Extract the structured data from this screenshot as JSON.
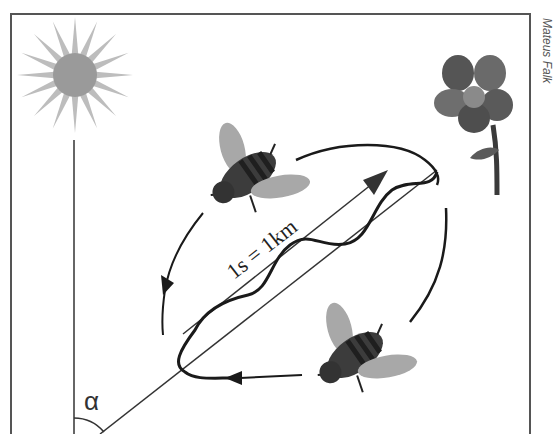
{
  "diagram": {
    "credit": "Mateus Falk",
    "scale_label": "1s = 1km",
    "angle_label": "α",
    "colors": {
      "frame": "#555555",
      "sun_rays": "#bdbdbd",
      "sun_core": "#9a9a9a",
      "flower_petals": "#5e5e5e",
      "flower_center": "#8a8a8a",
      "flower_stem": "#3a3a3a",
      "bee_body": "#3c3c3c",
      "bee_stripes": "#1f1f1f",
      "bee_wings": "#a8a8a8",
      "path": "#1a1a1a"
    },
    "elements": [
      "sun",
      "flower",
      "bee-top",
      "bee-bottom",
      "direction-line",
      "waggle-path",
      "return-loop-left",
      "return-loop-right",
      "vertical-reference-line",
      "angle-arc"
    ]
  }
}
